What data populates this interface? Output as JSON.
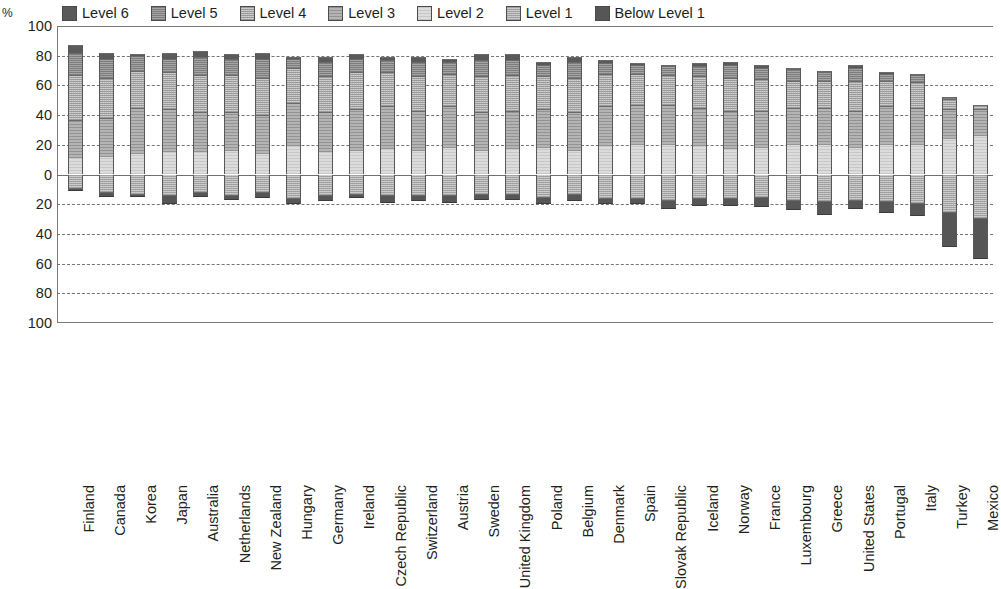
{
  "axis": {
    "unit": "%",
    "y_ticks": [
      "100",
      "80",
      "60",
      "40",
      "20",
      "0",
      "20",
      "40",
      "60",
      "80",
      "100"
    ],
    "y_values": [
      100,
      80,
      60,
      40,
      20,
      0,
      -20,
      -40,
      -60,
      -80,
      -100
    ]
  },
  "legend": {
    "items": [
      {
        "label": "Level 6",
        "color": "#5a5a5a",
        "pattern": "solid-dark"
      },
      {
        "label": "Level 5",
        "color": "#7d7d7d",
        "pattern": "checker-mid"
      },
      {
        "label": "Level 4",
        "color": "#9a9a9a",
        "pattern": "checker-light"
      },
      {
        "label": "Level 3",
        "color": "#b4b4b4",
        "pattern": "light-grid"
      },
      {
        "label": "Level 2",
        "color": "#dcdcdc",
        "pattern": "very-light"
      },
      {
        "label": "Level 1",
        "color": "#a0a0a0",
        "pattern": "checker-mid2"
      },
      {
        "label": "Below Level 1",
        "color": "#565656",
        "pattern": "solid-darkest"
      }
    ]
  },
  "chart_data": {
    "type": "bar",
    "subtype": "diverging-stacked",
    "title": "",
    "xlabel": "",
    "ylabel": "%",
    "ylim": [
      -100,
      100
    ],
    "grid": true,
    "legend_position": "top",
    "note": "Positive axis stacks Levels 2-6 (bottom to top: Level 2, Level 3, Level 4, Level 5, Level 6). Negative axis stacks Level 1 then Below Level 1 downward.",
    "categories": [
      "Finland",
      "Canada",
      "Korea",
      "Japan",
      "Australia",
      "Netherlands",
      "New Zealand",
      "Hungary",
      "Germany",
      "Ireland",
      "Czech Republic",
      "Switzerland",
      "Austria",
      "Sweden",
      "United Kingdom",
      "Poland",
      "Belgium",
      "Denmark",
      "Spain",
      "Slovak Republic",
      "Iceland",
      "Norway",
      "France",
      "Luxembourg",
      "Greece",
      "United States",
      "Portugal",
      "Italy",
      "Turkey",
      "Mexico"
    ],
    "series": [
      {
        "name": "Level 2",
        "values": [
          11,
          12,
          14,
          15,
          15,
          16,
          14,
          19,
          15,
          16,
          17,
          16,
          18,
          16,
          17,
          18,
          16,
          19,
          20,
          20,
          19,
          17,
          18,
          20,
          20,
          18,
          20,
          20,
          24,
          26
        ]
      },
      {
        "name": "Level 3",
        "values": [
          26,
          26,
          31,
          29,
          27,
          26,
          26,
          29,
          27,
          28,
          29,
          27,
          28,
          26,
          26,
          26,
          26,
          27,
          27,
          27,
          26,
          26,
          25,
          25,
          25,
          25,
          26,
          25,
          20,
          18
        ]
      },
      {
        "name": "Level 4",
        "values": [
          30,
          27,
          25,
          25,
          25,
          25,
          25,
          24,
          24,
          25,
          23,
          23,
          22,
          24,
          24,
          22,
          23,
          22,
          21,
          20,
          21,
          22,
          21,
          18,
          18,
          20,
          17,
          17,
          7,
          3
        ]
      },
      {
        "name": "Level 5",
        "values": [
          15,
          13,
          10,
          9,
          12,
          11,
          13,
          6,
          10,
          9,
          8,
          10,
          8,
          11,
          10,
          8,
          11,
          7,
          6,
          6,
          7,
          9,
          8,
          8,
          6,
          9,
          5,
          5,
          1,
          0
        ]
      },
      {
        "name": "Level 6",
        "values": [
          5,
          4,
          1,
          4,
          4,
          3,
          4,
          1,
          3,
          3,
          2,
          3,
          2,
          4,
          4,
          2,
          3,
          2,
          1,
          1,
          2,
          2,
          2,
          1,
          1,
          2,
          1,
          1,
          0,
          0
        ]
      },
      {
        "name": "Level 1",
        "values": [
          -9,
          -12,
          -13,
          -14,
          -12,
          -14,
          -12,
          -16,
          -14,
          -13,
          -14,
          -14,
          -14,
          -13,
          -13,
          -15,
          -13,
          -16,
          -16,
          -17,
          -16,
          -16,
          -15,
          -17,
          -18,
          -17,
          -18,
          -19,
          -25,
          -29
        ]
      },
      {
        "name": "Below Level 1",
        "values": [
          -2,
          -3,
          -2,
          -6,
          -3,
          -3,
          -4,
          -4,
          -4,
          -3,
          -5,
          -4,
          -5,
          -4,
          -4,
          -5,
          -5,
          -4,
          -4,
          -6,
          -5,
          -5,
          -7,
          -7,
          -9,
          -6,
          -8,
          -9,
          -24,
          -28
        ]
      }
    ]
  }
}
